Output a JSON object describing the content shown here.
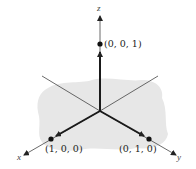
{
  "diagram": {
    "type": "3d-coordinate-axes",
    "axes": {
      "x": {
        "label": "x"
      },
      "y": {
        "label": "y"
      },
      "z": {
        "label": "z"
      }
    },
    "points": [
      {
        "name": "unit-z",
        "label": "(0, 0, 1)"
      },
      {
        "name": "unit-x",
        "label": "(1, 0, 0)"
      },
      {
        "name": "unit-y",
        "label": "(0, 1, 0)"
      }
    ],
    "colors": {
      "axis": "#333333",
      "vector": "#1a1a1a",
      "plane": "#e6e6e6",
      "point": "#111111"
    }
  }
}
